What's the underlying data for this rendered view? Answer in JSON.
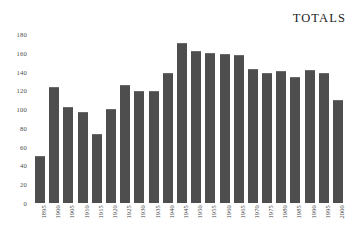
{
  "chart_data": {
    "type": "bar",
    "title": "TOTALS",
    "xlabel": "",
    "ylabel": "",
    "ylim": [
      0,
      180
    ],
    "ytick_step": 20,
    "grid": false,
    "legend": null,
    "bar_color": "#4e4e4e",
    "background_color": "#ffffff",
    "text_color": "#2b2b2b",
    "ytick_labels": [
      "180",
      "160",
      "140",
      "120",
      "100",
      "80",
      "60",
      "40",
      "20",
      "0"
    ],
    "ytick_values": [
      180,
      160,
      140,
      120,
      100,
      80,
      60,
      40,
      20,
      0
    ],
    "categories": [
      "1895",
      "1900",
      "1905",
      "1910",
      "1915",
      "1920",
      "1925",
      "1930",
      "1935",
      "1940",
      "1945",
      "1950",
      "1955",
      "1960",
      "1965",
      "1970",
      "1975",
      "1980",
      "1985",
      "1990",
      "1995",
      "2000"
    ],
    "values": [
      50,
      124,
      102,
      97,
      73,
      100,
      126,
      119,
      119,
      139,
      170,
      162,
      160,
      159,
      158,
      143,
      138,
      141,
      134,
      142,
      138,
      110
    ]
  }
}
